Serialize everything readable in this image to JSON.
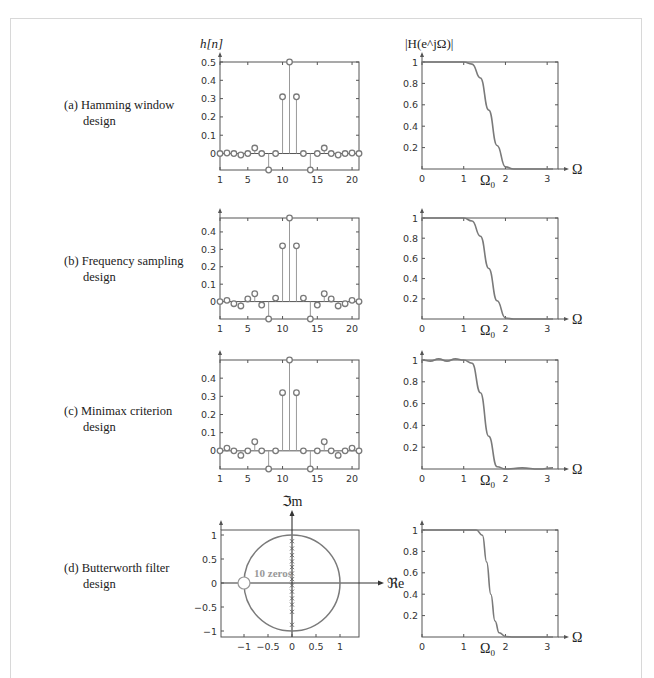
{
  "figure": {
    "rows": [
      {
        "id": "a",
        "label_line1": "(a) Hamming window",
        "label_line2": "design"
      },
      {
        "id": "b",
        "label_line1": "(b) Frequency sampling",
        "label_line2": "design"
      },
      {
        "id": "c",
        "label_line1": "(c) Minimax criterion",
        "label_line2": "design"
      },
      {
        "id": "d",
        "label_line1": "(d) Butterworth filter",
        "label_line2": "design"
      }
    ],
    "impulse_ylabel": "h[n]",
    "freq_ylabel": "|H(e^jΩ)|",
    "freq_xlabel": "Ω",
    "omega0_label": "Ω0",
    "pz_ylabel": "ℑm",
    "pz_xlabel": "ℜe",
    "pz_annotation": "10 zeros"
  },
  "chart_data": [
    {
      "type": "scatter",
      "title": "(a) Hamming window design — impulse response",
      "ylabel": "h[n]",
      "x": [
        1,
        2,
        3,
        4,
        5,
        6,
        7,
        8,
        9,
        10,
        11,
        12,
        13,
        14,
        15,
        16,
        17,
        18,
        19,
        20,
        21
      ],
      "values": [
        0,
        0.003,
        0,
        -0.008,
        0,
        0.03,
        0,
        -0.09,
        0,
        0.31,
        0.5,
        0.31,
        0,
        -0.09,
        0,
        0.03,
        0,
        -0.008,
        0,
        0.003,
        0
      ],
      "xticks": [
        1,
        5,
        10,
        15,
        20
      ],
      "yticks": [
        0,
        0.1,
        0.2,
        0.3,
        0.4,
        0.5
      ],
      "xlim": [
        1,
        21
      ],
      "ylim": [
        -0.09,
        0.5
      ]
    },
    {
      "type": "line",
      "title": "(a) Hamming window design — magnitude response",
      "ylabel": "|H(e^jΩ)|",
      "xlabel": "Ω",
      "x": [
        0,
        0.5,
        1.0,
        1.2,
        1.4,
        1.6,
        1.8,
        2.0,
        2.2,
        3.14
      ],
      "values": [
        1,
        1,
        1,
        0.98,
        0.85,
        0.55,
        0.22,
        0.02,
        0,
        0
      ],
      "xticks": [
        0,
        1,
        2,
        3
      ],
      "yticks": [
        0.2,
        0.4,
        0.6,
        0.8,
        1
      ],
      "annotation": "Ω0 ≈ 1.57",
      "xlim": [
        0,
        3.14
      ],
      "ylim": [
        0,
        1
      ]
    },
    {
      "type": "scatter",
      "title": "(b) Frequency sampling design — impulse response",
      "ylabel": "h[n]",
      "x": [
        1,
        2,
        3,
        4,
        5,
        6,
        7,
        8,
        9,
        10,
        11,
        12,
        13,
        14,
        15,
        16,
        17,
        18,
        19,
        20,
        21
      ],
      "values": [
        0,
        0.007,
        -0.012,
        -0.025,
        0.015,
        0.045,
        -0.02,
        -0.1,
        0.02,
        0.32,
        0.48,
        0.32,
        0.02,
        -0.1,
        -0.02,
        0.045,
        0.015,
        -0.025,
        -0.012,
        0.007,
        0
      ],
      "xticks": [
        1,
        5,
        10,
        15,
        20
      ],
      "yticks": [
        0,
        0.1,
        0.2,
        0.3,
        0.4
      ],
      "xlim": [
        1,
        21
      ],
      "ylim": [
        -0.1,
        0.48
      ]
    },
    {
      "type": "line",
      "title": "(b) Frequency sampling design — magnitude response",
      "ylabel": "|H(e^jΩ)|",
      "xlabel": "Ω",
      "x": [
        0,
        0.5,
        1.0,
        1.2,
        1.4,
        1.6,
        1.8,
        2.0,
        2.2,
        3.14
      ],
      "values": [
        1,
        1,
        1,
        0.97,
        0.82,
        0.5,
        0.18,
        0.01,
        0,
        0
      ],
      "xticks": [
        0,
        1,
        2,
        3
      ],
      "yticks": [
        0.2,
        0.4,
        0.6,
        0.8,
        1
      ],
      "annotation": "Ω0 ≈ 1.57",
      "xlim": [
        0,
        3.14
      ],
      "ylim": [
        0,
        1
      ]
    },
    {
      "type": "scatter",
      "title": "(c) Minimax criterion design — impulse response",
      "ylabel": "h[n]",
      "x": [
        1,
        2,
        3,
        4,
        5,
        6,
        7,
        8,
        9,
        10,
        11,
        12,
        13,
        14,
        15,
        16,
        17,
        18,
        19,
        20,
        21
      ],
      "values": [
        0,
        0.015,
        0,
        -0.025,
        0,
        0.05,
        0,
        -0.1,
        0,
        0.32,
        0.5,
        0.32,
        0,
        -0.1,
        0,
        0.05,
        0,
        -0.025,
        0,
        0.015,
        0
      ],
      "xticks": [
        1,
        5,
        10,
        15,
        20
      ],
      "yticks": [
        0,
        0.1,
        0.2,
        0.3,
        0.4
      ],
      "xlim": [
        1,
        21
      ],
      "ylim": [
        -0.1,
        0.5
      ]
    },
    {
      "type": "line",
      "title": "(c) Minimax criterion design — magnitude response",
      "ylabel": "|H(e^jΩ)|",
      "xlabel": "Ω",
      "x": [
        0,
        0.2,
        0.4,
        0.6,
        0.8,
        1.0,
        1.2,
        1.4,
        1.6,
        1.8,
        2.0,
        2.4,
        2.8,
        3.14
      ],
      "values": [
        1,
        0.99,
        1.01,
        0.99,
        1.01,
        1,
        0.97,
        0.7,
        0.3,
        0.02,
        0,
        0.01,
        0,
        0.01
      ],
      "xticks": [
        0,
        1,
        2,
        3
      ],
      "yticks": [
        0.2,
        0.4,
        0.6,
        0.8,
        1
      ],
      "annotation": "Ω0 ≈ 1.57",
      "xlim": [
        0,
        3.14
      ],
      "ylim": [
        0,
        1
      ]
    },
    {
      "type": "scatter",
      "title": "(d) Butterworth filter design — pole-zero plot",
      "xlabel": "ℜe",
      "ylabel": "ℑm",
      "series": [
        {
          "name": "poles",
          "x": [
            0,
            0,
            0,
            0,
            0,
            0,
            0,
            0,
            0,
            0
          ],
          "values": [
            0.87,
            0.72,
            0.58,
            0.45,
            0.33,
            0.2,
            0.08,
            -0.05,
            -0.18,
            -0.32,
            -0.45,
            -0.6,
            -0.87
          ]
        },
        {
          "name": "zeros",
          "x": [
            -1
          ],
          "values": [
            0
          ],
          "annotation": "10 zeros"
        },
        {
          "name": "unit circle",
          "radius": 1
        }
      ],
      "xticks": [
        -1,
        -0.5,
        0,
        0.5,
        1
      ],
      "yticks": [
        -1,
        -0.5,
        0,
        0.5,
        1
      ],
      "xlim": [
        -1.45,
        1.45
      ],
      "ylim": [
        -1.1,
        1.1
      ]
    },
    {
      "type": "line",
      "title": "(d) Butterworth filter design — magnitude response",
      "ylabel": "|H(e^jΩ)|",
      "xlabel": "Ω",
      "x": [
        0,
        0.5,
        1.0,
        1.3,
        1.45,
        1.55,
        1.65,
        1.75,
        1.85,
        2.0,
        2.2,
        3.14
      ],
      "values": [
        1,
        1,
        1,
        1,
        0.95,
        0.7,
        0.4,
        0.15,
        0.04,
        0.005,
        0,
        0
      ],
      "xticks": [
        0,
        1,
        2,
        3
      ],
      "yticks": [
        0.2,
        0.4,
        0.6,
        0.8,
        1
      ],
      "annotation": "Ω0 ≈ 1.57",
      "xlim": [
        0,
        3.14
      ],
      "ylim": [
        0,
        1
      ]
    }
  ]
}
